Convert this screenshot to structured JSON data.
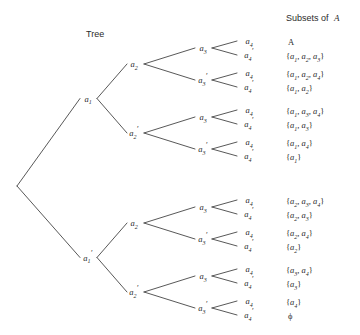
{
  "figure": {
    "headers": {
      "tree_label": "Tree",
      "subsets_label": "Subsets of",
      "subsets_label_italic": "A"
    },
    "tree": {
      "root_label": "",
      "level1": [
        {
          "id": "a1",
          "base": "a",
          "sub": "1",
          "prime": false
        },
        {
          "id": "a1p",
          "base": "a",
          "sub": "1",
          "prime": true
        }
      ],
      "level2": [
        {
          "id": "a2",
          "base": "a",
          "sub": "2",
          "prime": false
        },
        {
          "id": "a2p",
          "base": "a",
          "sub": "2",
          "prime": true
        },
        {
          "id": "a2",
          "base": "a",
          "sub": "2",
          "prime": false
        },
        {
          "id": "a2p",
          "base": "a",
          "sub": "2",
          "prime": true
        }
      ],
      "level3": [
        {
          "id": "a3",
          "base": "a",
          "sub": "3",
          "prime": false
        },
        {
          "id": "a3p",
          "base": "a",
          "sub": "3",
          "prime": true
        },
        {
          "id": "a3",
          "base": "a",
          "sub": "3",
          "prime": false
        },
        {
          "id": "a3p",
          "base": "a",
          "sub": "3",
          "prime": true
        },
        {
          "id": "a3",
          "base": "a",
          "sub": "3",
          "prime": false
        },
        {
          "id": "a3p",
          "base": "a",
          "sub": "3",
          "prime": true
        },
        {
          "id": "a3",
          "base": "a",
          "sub": "3",
          "prime": false
        },
        {
          "id": "a3p",
          "base": "a",
          "sub": "3",
          "prime": true
        }
      ],
      "leaves": [
        {
          "base": "a",
          "sub": "4",
          "prime": false,
          "subset": "A"
        },
        {
          "base": "a",
          "sub": "4",
          "prime": true,
          "subset": "{a1, a2, a3}"
        },
        {
          "base": "a",
          "sub": "4",
          "prime": false,
          "subset": "{a1, a2, a4}"
        },
        {
          "base": "a",
          "sub": "4",
          "prime": true,
          "subset": "{a1, a2}"
        },
        {
          "base": "a",
          "sub": "4",
          "prime": false,
          "subset": "{a1, a3, a4}"
        },
        {
          "base": "a",
          "sub": "4",
          "prime": true,
          "subset": "{a1, a3}"
        },
        {
          "base": "a",
          "sub": "4",
          "prime": false,
          "subset": "{a1, a4}"
        },
        {
          "base": "a",
          "sub": "4",
          "prime": true,
          "subset": "{a1}"
        },
        {
          "base": "a",
          "sub": "4",
          "prime": false,
          "subset": "{a2, a3, a4}"
        },
        {
          "base": "a",
          "sub": "4",
          "prime": true,
          "subset": "{a2, a3}"
        },
        {
          "base": "a",
          "sub": "4",
          "prime": false,
          "subset": "{a2, a4}"
        },
        {
          "base": "a",
          "sub": "4",
          "prime": true,
          "subset": "{a2}"
        },
        {
          "base": "a",
          "sub": "4",
          "prime": false,
          "subset": "{a3, a4}"
        },
        {
          "base": "a",
          "sub": "4",
          "prime": true,
          "subset": "{a3}"
        },
        {
          "base": "a",
          "sub": "4",
          "prime": false,
          "subset": "{a4}"
        },
        {
          "base": "a",
          "sub": "4",
          "prime": true,
          "subset": "ϕ"
        }
      ],
      "subset_tokens": [
        {
          "plain": "A",
          "items": []
        },
        {
          "plain": "",
          "items": [
            "1",
            "2",
            "3"
          ]
        },
        {
          "plain": "",
          "items": [
            "1",
            "2",
            "4"
          ]
        },
        {
          "plain": "",
          "items": [
            "1",
            "2"
          ]
        },
        {
          "plain": "",
          "items": [
            "1",
            "3",
            "4"
          ]
        },
        {
          "plain": "",
          "items": [
            "1",
            "3"
          ]
        },
        {
          "plain": "",
          "items": [
            "1",
            "4"
          ]
        },
        {
          "plain": "",
          "items": [
            "1"
          ]
        },
        {
          "plain": "",
          "items": [
            "2",
            "3",
            "4"
          ]
        },
        {
          "plain": "",
          "items": [
            "2",
            "3"
          ]
        },
        {
          "plain": "",
          "items": [
            "2",
            "4"
          ]
        },
        {
          "plain": "",
          "items": [
            "2"
          ]
        },
        {
          "plain": "",
          "items": [
            "3",
            "4"
          ]
        },
        {
          "plain": "",
          "items": [
            "3"
          ]
        },
        {
          "plain": "",
          "items": [
            "4"
          ]
        },
        {
          "plain": "ϕ",
          "items": []
        }
      ]
    },
    "colors": {
      "line": "#3a3a3a",
      "text": "#2b2b2b",
      "background": "#ffffff"
    }
  }
}
